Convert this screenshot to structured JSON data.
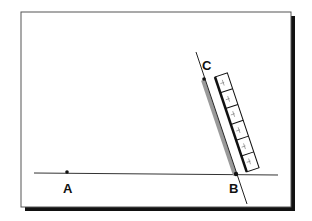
{
  "diagram": {
    "frame": {
      "x": 21,
      "y": 12,
      "width": 270,
      "height": 195,
      "shadow_color": "#111111",
      "border_color": "#555555"
    },
    "baseline": {
      "x1": 34,
      "y1": 173,
      "x2": 278,
      "y2": 175
    },
    "slanted_line": {
      "x1": 196,
      "y1": 52,
      "x2": 247,
      "y2": 204
    },
    "points": [
      {
        "id": "A",
        "label": "A",
        "x": 67,
        "y": 172,
        "label_x": 67,
        "label_y": 193
      },
      {
        "id": "B",
        "label": "B",
        "x": 236,
        "y": 174,
        "label_x": 233,
        "label_y": 193
      },
      {
        "id": "C",
        "label": "C",
        "x": 204,
        "y": 79,
        "label_x": 207,
        "label_y": 70
      }
    ],
    "highlight_segment": {
      "from": "C",
      "to": "B",
      "color": "#9a9a9a"
    },
    "ruler": {
      "segments": 6,
      "color": "#111111"
    }
  }
}
